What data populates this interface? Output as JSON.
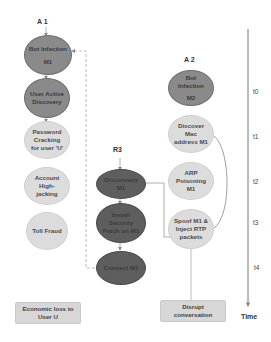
{
  "diagram": {
    "actors": {
      "a1": "A 1",
      "a2": "A 2",
      "r3": "R3"
    },
    "column_a1": [
      {
        "id": "bot_m1",
        "label_line1": "Bot Infection",
        "label_line2": "M1",
        "style": "dark"
      },
      {
        "id": "user_discovery",
        "label_line1": "User Active",
        "label_line2": "Discovery",
        "style": "dark"
      },
      {
        "id": "password_crack",
        "label": "Password Cracking for user 'U'",
        "style": "light"
      },
      {
        "id": "account_hijack",
        "label": "Account High-jacking",
        "style": "light"
      },
      {
        "id": "toll_fraud",
        "label": "Toll Fraud",
        "style": "light"
      }
    ],
    "column_r3": [
      {
        "id": "disconnect",
        "label": "Disconnect M1",
        "style": "darker"
      },
      {
        "id": "install_patch",
        "label": "Install Security Patch on M1",
        "style": "darker"
      },
      {
        "id": "connect",
        "label": "Connect M1",
        "style": "darker"
      }
    ],
    "column_a2": [
      {
        "id": "bot_m2",
        "label_line1": "Bot Infection",
        "label_line2": "M2",
        "style": "dark"
      },
      {
        "id": "discover_mac",
        "label": "Discover Mac address M1",
        "style": "light"
      },
      {
        "id": "arp",
        "label": "ARP Poisoning M1",
        "style": "light"
      },
      {
        "id": "spoof",
        "label": "Spoof M1 & Inject RTP packets",
        "style": "light"
      }
    ],
    "outcomes": {
      "economic_loss": "Economic loss to User U",
      "disrupt": "Disrupt conversation"
    },
    "timeline": {
      "ticks": [
        "t0",
        "t1",
        "t2",
        "t3",
        "t4"
      ],
      "axis_label": "Time"
    },
    "colors": {
      "dark_node": "#8a8a8a",
      "darker_node": "#5e5e5e",
      "light_node": "#dcdcdc",
      "outcome_box": "#d7d7d7",
      "line": "#9a9a9a"
    }
  }
}
